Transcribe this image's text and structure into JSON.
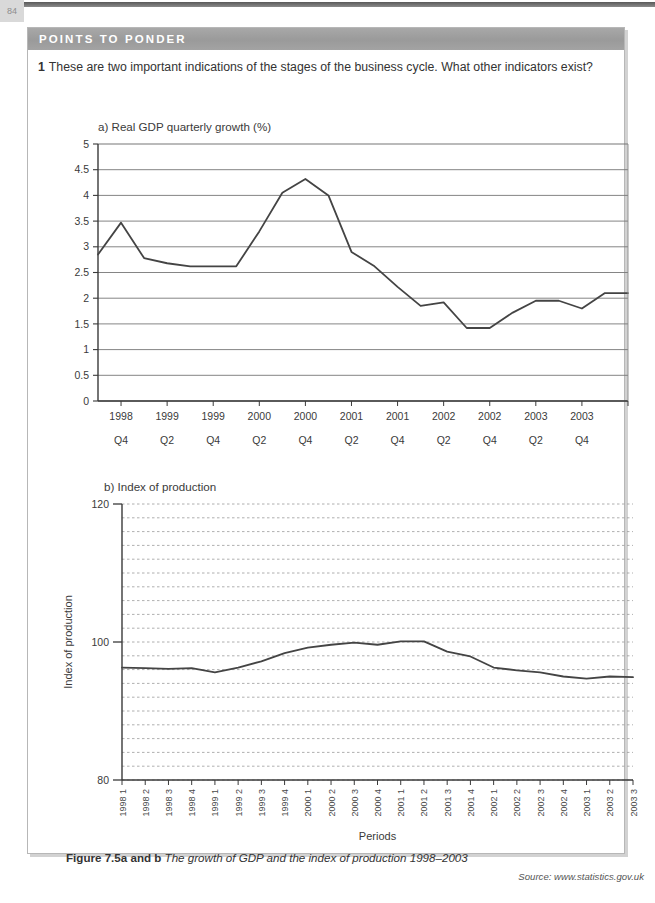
{
  "page": {
    "page_number": "84",
    "panel_header": "POINTS TO PONDER",
    "question_number": "1",
    "question_text": "These are two important indications of the stages of the business cycle. What other indicators exist?",
    "caption_label": "Figure 7.5a and b",
    "caption_text": "The growth of GDP and the index of production 1998–2003",
    "source": "Source: www.statistics.gov.uk",
    "colors": {
      "header_bar": "#9e9e9e",
      "panel_border": "#b7b7b7",
      "line": "#444444",
      "grid": "#777777",
      "grid_dotted": "#9a9a9a",
      "text": "#333333"
    }
  },
  "chart_data": [
    {
      "id": "chart-a",
      "type": "line",
      "title": "a)  Real GDP quarterly growth (%)",
      "xlabel": "",
      "ylabel": "",
      "ylim": [
        0,
        5
      ],
      "yticks": [
        0,
        0.5,
        1,
        1.5,
        2,
        2.5,
        3,
        3.5,
        4,
        4.5,
        5
      ],
      "ytick_labels": [
        "0",
        "0.5",
        "1",
        "1.5",
        "2",
        "2.5",
        "3",
        "3.5",
        "4",
        "4.5",
        "5"
      ],
      "grid": "solid-horizontal",
      "legend": "none",
      "categories": [
        "1998 Q3",
        "1998 Q4",
        "1999 Q1",
        "1999 Q2",
        "1999 Q3",
        "1999 Q4",
        "2000 Q1",
        "2000 Q2",
        "2000 Q3",
        "2000 Q4",
        "2001 Q1",
        "2001 Q2",
        "2001 Q3",
        "2001 Q4",
        "2002 Q1",
        "2002 Q2",
        "2002 Q3",
        "2002 Q4",
        "2003 Q1",
        "2003 Q2",
        "2003 Q3",
        "2003 Q4"
      ],
      "xtick_labels": [
        {
          "year": "1998",
          "quarter": "Q4"
        },
        {
          "year": "1999",
          "quarter": "Q2"
        },
        {
          "year": "1999",
          "quarter": "Q4"
        },
        {
          "year": "2000",
          "quarter": "Q2"
        },
        {
          "year": "2000",
          "quarter": "Q4"
        },
        {
          "year": "2001",
          "quarter": "Q2"
        },
        {
          "year": "2001",
          "quarter": "Q4"
        },
        {
          "year": "2002",
          "quarter": "Q2"
        },
        {
          "year": "2002",
          "quarter": "Q4"
        },
        {
          "year": "2003",
          "quarter": "Q2"
        },
        {
          "year": "2003",
          "quarter": "Q4"
        }
      ],
      "values": [
        2.85,
        3.47,
        2.78,
        2.68,
        2.62,
        2.62,
        2.62,
        3.3,
        4.05,
        4.32,
        4.0,
        2.9,
        2.62,
        2.22,
        1.85,
        1.92,
        1.42,
        1.42,
        1.72,
        1.95,
        1.95,
        1.8,
        2.1,
        2.1
      ]
    },
    {
      "id": "chart-b",
      "type": "line",
      "title": "b) Index of production",
      "xlabel": "Periods",
      "ylabel": "Index of production",
      "ylim": [
        80,
        120
      ],
      "yticks": [
        80,
        100,
        120
      ],
      "ytick_labels": [
        "80",
        "100",
        "120"
      ],
      "grid": "dotted-horizontal-every-2",
      "legend": "none",
      "categories": [
        "1998 1",
        "1998 2",
        "1998 3",
        "1998 4",
        "1999 1",
        "1999 2",
        "1999 3",
        "1999 4",
        "2000 1",
        "2000 2",
        "2000 3",
        "2000 4",
        "2001 1",
        "2001 2",
        "2001 3",
        "2001 4",
        "2002 1",
        "2002 2",
        "2002 3",
        "2002 4",
        "2003 1",
        "2003 2",
        "2003 3"
      ],
      "values": [
        96.3,
        96.2,
        96.1,
        96.2,
        95.6,
        96.3,
        97.2,
        98.4,
        99.2,
        99.6,
        99.9,
        99.6,
        100.1,
        100.1,
        98.6,
        97.9,
        96.3,
        95.9,
        95.6,
        95.0,
        94.7,
        95.0,
        94.9
      ]
    }
  ]
}
